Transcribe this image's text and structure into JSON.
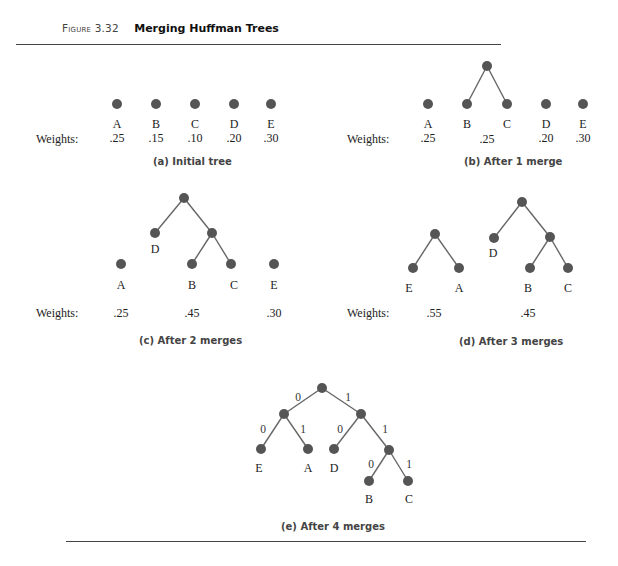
{
  "figure": {
    "number": "Figure 3.32",
    "title": "Merging Huffman Trees"
  },
  "weights_label": "Weights:",
  "panels": {
    "a": {
      "caption": "(a)  Initial tree",
      "leaves": [
        "A",
        "B",
        "C",
        "D",
        "E"
      ],
      "weights": [
        ".25",
        ".15",
        ".10",
        ".20",
        ".30"
      ]
    },
    "b": {
      "caption": "(b)  After 1 merge",
      "leaves": [
        "A",
        "B",
        "C",
        "D",
        "E"
      ],
      "weights": [
        ".25",
        ".25",
        ".20",
        ".30"
      ]
    },
    "c": {
      "caption": "(c)  After 2 merges",
      "leaves": [
        "A",
        "D",
        "B",
        "C",
        "E"
      ],
      "weights": [
        ".25",
        ".45",
        ".30"
      ]
    },
    "d": {
      "caption": "(d)  After 3 merges",
      "leaves": [
        "E",
        "A",
        "D",
        "B",
        "C"
      ],
      "weights": [
        ".55",
        ".45"
      ]
    },
    "e": {
      "caption": "(e)  After 4 merges",
      "leaves": [
        "E",
        "A",
        "D",
        "B",
        "C"
      ],
      "edge_bits": [
        "0",
        "1",
        "0",
        "1",
        "0",
        "1",
        "0",
        "1"
      ]
    }
  },
  "colors": {
    "node": "#555555",
    "edge": "#666666",
    "rule": "#444444"
  }
}
